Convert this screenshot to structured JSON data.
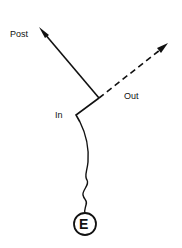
{
  "labels": {
    "post": "Post",
    "out": "Out",
    "in": "In",
    "node": "E"
  },
  "colors": {
    "stroke": "#111111",
    "background": "#ffffff"
  }
}
